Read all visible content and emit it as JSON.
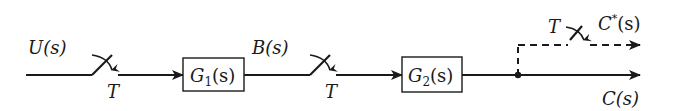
{
  "diagram": {
    "type": "sampled-data block diagram",
    "signals": {
      "input": "U(s)",
      "intermediate": "B(s)",
      "output": "C(s)",
      "sampled_output": "C*(s)"
    },
    "blocks": [
      {
        "id": "g1",
        "label": "G",
        "subscript": "1",
        "arg": "(s)"
      },
      {
        "id": "g2",
        "label": "G",
        "subscript": "2",
        "arg": "(s)"
      }
    ],
    "samplers": [
      {
        "id": "sampler-1",
        "period_label": "T"
      },
      {
        "id": "sampler-2",
        "period_label": "T"
      },
      {
        "id": "sampler-3",
        "period_label": "T"
      }
    ],
    "labels": {
      "u": "U(s)",
      "b": "B(s)",
      "c": "C(s)",
      "c_star_base": "C",
      "c_star_sup": "*",
      "c_star_arg": "(s)"
    },
    "colors": {
      "stroke": "#1a1a1a",
      "background": "#ffffff"
    }
  }
}
